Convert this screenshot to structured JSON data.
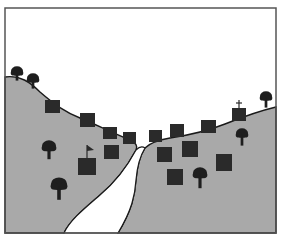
{
  "scene": {
    "title": "Valley with river and buildings",
    "colors": {
      "sky": "#ffffff",
      "hill": "#a9a9a9",
      "outline": "#1a1a1a",
      "frame": "#555555",
      "river": "#ffffff",
      "building": "#2a2a2a",
      "tree": "#1e1e1e"
    },
    "frame": {
      "x": 5,
      "y": 8,
      "width": 271,
      "height": 225
    },
    "left_hill_path": "M5,77 C20,75 30,82 40,92 C55,105 65,112 80,118 C95,124 110,132 130,140 C136,143 138,146 136,150 C128,165 118,180 100,195 C85,208 70,220 64,233 L5,233 Z",
    "right_hill_path": "M276,107 C255,112 240,118 225,124 C205,132 190,135 170,138 C158,140 150,143 145,148 C140,156 137,168 136,180 C135,195 132,210 118,233 L276,233 Z",
    "river_path": "M136,150 C128,165 118,180 100,195 C85,208 70,220 64,233 L118,233 C132,210 135,195 136,180 C137,168 140,156 145,148 C142,146 139,147 136,150 Z",
    "buildings": [
      {
        "name": "left-hill-house-1",
        "x": 45,
        "y": 100,
        "w": 15,
        "h": 13
      },
      {
        "name": "left-hill-house-2",
        "x": 80,
        "y": 113,
        "w": 15,
        "h": 14
      },
      {
        "name": "left-hill-house-3",
        "x": 103,
        "y": 127,
        "w": 14,
        "h": 12
      },
      {
        "name": "left-hill-house-4",
        "x": 123,
        "y": 132,
        "w": 13,
        "h": 12
      },
      {
        "name": "river-house",
        "x": 149,
        "y": 130,
        "w": 13,
        "h": 12
      },
      {
        "name": "right-hill-house-1",
        "x": 170,
        "y": 124,
        "w": 14,
        "h": 13
      },
      {
        "name": "right-hill-house-2",
        "x": 201,
        "y": 120,
        "w": 15,
        "h": 13
      },
      {
        "name": "field-house-1",
        "x": 104,
        "y": 145,
        "w": 15,
        "h": 14
      },
      {
        "name": "field-house-2",
        "x": 157,
        "y": 147,
        "w": 15,
        "h": 15
      },
      {
        "name": "field-house-3",
        "x": 182,
        "y": 141,
        "w": 16,
        "h": 16
      },
      {
        "name": "field-house-4",
        "x": 216,
        "y": 154,
        "w": 16,
        "h": 17
      },
      {
        "name": "field-house-5",
        "x": 167,
        "y": 169,
        "w": 16,
        "h": 16
      }
    ],
    "flag_house": {
      "x": 78,
      "y": 158,
      "w": 18,
      "h": 17,
      "pole_x": 87,
      "pole_top": 145
    },
    "church": {
      "x": 232,
      "y": 108,
      "w": 14,
      "h": 13,
      "cross_x": 239,
      "cross_top": 100
    },
    "trees": [
      {
        "name": "tree-hilltop-1",
        "cx": 17,
        "cy": 72,
        "r": 6,
        "trunk_h": 5
      },
      {
        "name": "tree-hilltop-2",
        "cx": 33,
        "cy": 79,
        "r": 6,
        "trunk_h": 6
      },
      {
        "name": "tree-hilltop-right",
        "cx": 266,
        "cy": 97,
        "r": 6,
        "trunk_h": 7
      },
      {
        "name": "tree-left-field-1",
        "cx": 49,
        "cy": 147,
        "r": 7,
        "trunk_h": 8
      },
      {
        "name": "tree-left-field-2",
        "cx": 59,
        "cy": 185,
        "r": 8,
        "trunk_h": 10
      },
      {
        "name": "tree-right-field-1",
        "cx": 242,
        "cy": 134,
        "r": 6,
        "trunk_h": 8
      },
      {
        "name": "tree-right-field-2",
        "cx": 200,
        "cy": 174,
        "r": 7,
        "trunk_h": 10
      }
    ]
  }
}
